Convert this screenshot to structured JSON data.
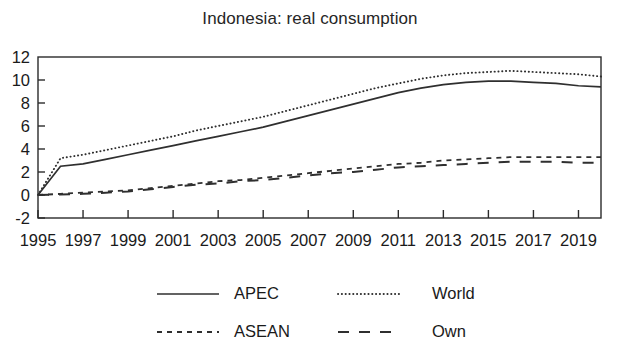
{
  "chart_data": {
    "type": "line",
    "title": "Indonesia: real consumption",
    "xlabel": "",
    "ylabel": "",
    "xlim": [
      1995,
      2020
    ],
    "ylim": [
      -2,
      12
    ],
    "grid": false,
    "legend_position": "bottom",
    "x": [
      1995,
      1996,
      1997,
      1998,
      1999,
      2000,
      2001,
      2002,
      2003,
      2004,
      2005,
      2006,
      2007,
      2008,
      2009,
      2010,
      2011,
      2012,
      2013,
      2014,
      2015,
      2016,
      2017,
      2018,
      2019,
      2020
    ],
    "xticks": [
      1995,
      1997,
      1999,
      2001,
      2003,
      2005,
      2007,
      2009,
      2011,
      2013,
      2015,
      2017,
      2019
    ],
    "xtick_labels": [
      "1995",
      "1997",
      "1999",
      "2001",
      "2003",
      "2005",
      "2007",
      "2009",
      "2011",
      "2013",
      "2015",
      "2017",
      "2019"
    ],
    "yticks": [
      -2,
      0,
      2,
      4,
      6,
      8,
      10,
      12
    ],
    "ytick_labels": [
      "-2",
      "0",
      "2",
      "4",
      "6",
      "8",
      "10",
      "12"
    ],
    "series": [
      {
        "name": "APEC",
        "style": "solid",
        "values": [
          0.0,
          2.5,
          2.7,
          3.1,
          3.5,
          3.9,
          4.3,
          4.7,
          5.1,
          5.5,
          5.9,
          6.4,
          6.9,
          7.4,
          7.9,
          8.4,
          8.9,
          9.3,
          9.6,
          9.8,
          9.9,
          9.9,
          9.8,
          9.7,
          9.5,
          9.4
        ]
      },
      {
        "name": "World",
        "style": "dotted",
        "values": [
          0.0,
          3.2,
          3.5,
          3.9,
          4.3,
          4.7,
          5.1,
          5.6,
          6.0,
          6.4,
          6.8,
          7.3,
          7.8,
          8.3,
          8.8,
          9.3,
          9.7,
          10.1,
          10.4,
          10.6,
          10.7,
          10.8,
          10.7,
          10.6,
          10.5,
          10.3
        ]
      },
      {
        "name": "ASEAN",
        "style": "short-dash",
        "values": [
          0.0,
          0.1,
          0.2,
          0.3,
          0.4,
          0.6,
          0.8,
          1.0,
          1.2,
          1.3,
          1.5,
          1.7,
          1.9,
          2.1,
          2.3,
          2.5,
          2.7,
          2.8,
          3.0,
          3.1,
          3.2,
          3.3,
          3.3,
          3.3,
          3.3,
          3.3
        ]
      },
      {
        "name": "Own",
        "style": "long-dash",
        "values": [
          0.0,
          0.05,
          0.1,
          0.2,
          0.3,
          0.5,
          0.7,
          0.9,
          1.0,
          1.2,
          1.3,
          1.5,
          1.7,
          1.9,
          2.0,
          2.2,
          2.4,
          2.5,
          2.6,
          2.7,
          2.8,
          2.9,
          2.9,
          2.9,
          2.8,
          2.8
        ]
      }
    ],
    "legend": [
      {
        "label": "APEC",
        "style": "solid"
      },
      {
        "label": "World",
        "style": "dotted"
      },
      {
        "label": "ASEAN",
        "style": "short-dash"
      },
      {
        "label": "Own",
        "style": "long-dash"
      }
    ],
    "colors": {
      "line": "#2f2f2f",
      "axis": "#2b2b2b",
      "text": "#1a1a1a",
      "background": "#ffffff"
    }
  }
}
